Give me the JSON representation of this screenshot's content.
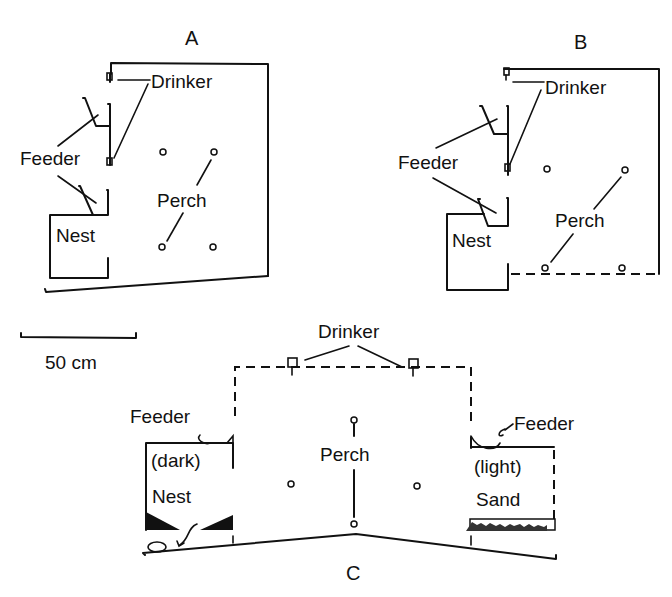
{
  "figure": {
    "panels": {
      "A": {
        "letter": "A",
        "labels": {
          "drinker": "Drinker",
          "feeder": "Feeder",
          "perch": "Perch",
          "nest": "Nest"
        }
      },
      "B": {
        "letter": "B",
        "labels": {
          "drinker": "Drinker",
          "feeder": "Feeder",
          "perch": "Perch",
          "nest": "Nest"
        }
      },
      "C": {
        "letter": "C",
        "labels": {
          "drinker": "Drinker",
          "feeder_left": "Feeder",
          "feeder_right": "Feeder",
          "perch": "Perch",
          "nest_qualifier": "(dark)",
          "nest": "Nest",
          "sand_qualifier": "(light)",
          "sand": "Sand"
        }
      }
    },
    "scale_bar": {
      "label": "50 cm"
    }
  }
}
